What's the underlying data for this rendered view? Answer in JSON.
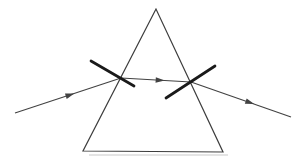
{
  "page": {
    "background": "#ffffff"
  },
  "diagram": {
    "width": 298,
    "height": 160,
    "colors": {
      "outline": "#3d3d3d",
      "ray": "#424242",
      "normal": "#1a1a1a",
      "shadow": "#cfcfcf"
    },
    "prism": {
      "points": [
        [
          156,
          9
        ],
        [
          83,
          151
        ],
        [
          223,
          152
        ]
      ],
      "stroke_width": 1.2
    },
    "base_shadow": {
      "from": [
        89,
        155
      ],
      "to": [
        228,
        155
      ],
      "stroke_width": 2,
      "opacity": 0.55
    },
    "ray_stroke_width": 1.1,
    "normal_stroke_width": 2.7,
    "arrow": {
      "length": 9,
      "half_width": 2.8
    },
    "rays": [
      {
        "name": "incident-ray",
        "from": [
          15,
          113
        ],
        "to": [
          121,
          78
        ],
        "arrow_t": 0.52
      },
      {
        "name": "internal-ray",
        "from": [
          121,
          78
        ],
        "to": [
          191,
          82
        ],
        "arrow_t": 0.56
      },
      {
        "name": "refracted-ray",
        "from": [
          191,
          82
        ],
        "to": [
          291,
          117
        ],
        "arrow_t": 0.59
      }
    ],
    "normals": [
      {
        "name": "normal-at-entry-face",
        "from": [
          91,
          61
        ],
        "to": [
          134,
          86
        ]
      },
      {
        "name": "normal-at-exit-face",
        "from": [
          166,
          98
        ],
        "to": [
          215,
          66
        ]
      }
    ]
  }
}
